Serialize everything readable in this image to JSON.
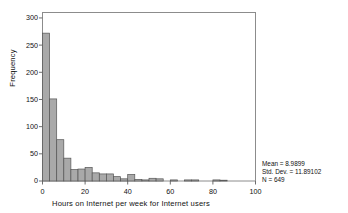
{
  "chart_data": {
    "type": "bar",
    "title": "",
    "subtitle": "",
    "xlabel": "Hours on Internet per week for Internet users",
    "ylabel": "Frequency",
    "xlim": [
      0,
      100
    ],
    "ylim": [
      0,
      310
    ],
    "xticks": [
      0,
      20,
      40,
      60,
      80,
      100
    ],
    "yticks": [
      0,
      50,
      100,
      150,
      200,
      250,
      300
    ],
    "xtick_labels": [
      "0",
      "20",
      "40",
      "60",
      "80",
      "100"
    ],
    "ytick_labels": [
      "0",
      "50",
      "100",
      "150",
      "200",
      "250",
      "300"
    ],
    "grid": false,
    "legend": false,
    "bin_width": 3.33,
    "bar_fill": "#a9a9a9",
    "bar_edge": "#555555",
    "frame_color": "#888888",
    "bins": [
      {
        "x0": 0.0,
        "x1": 3.33,
        "value": 272
      },
      {
        "x0": 3.33,
        "x1": 6.67,
        "value": 151
      },
      {
        "x0": 6.67,
        "x1": 10.0,
        "value": 76
      },
      {
        "x0": 10.0,
        "x1": 13.33,
        "value": 42
      },
      {
        "x0": 13.33,
        "x1": 16.67,
        "value": 21
      },
      {
        "x0": 16.67,
        "x1": 20.0,
        "value": 22
      },
      {
        "x0": 20.0,
        "x1": 23.33,
        "value": 25
      },
      {
        "x0": 23.33,
        "x1": 26.67,
        "value": 15
      },
      {
        "x0": 26.67,
        "x1": 30.0,
        "value": 13
      },
      {
        "x0": 30.0,
        "x1": 33.33,
        "value": 13
      },
      {
        "x0": 33.33,
        "x1": 36.67,
        "value": 8
      },
      {
        "x0": 36.67,
        "x1": 40.0,
        "value": 4
      },
      {
        "x0": 40.0,
        "x1": 43.33,
        "value": 12
      },
      {
        "x0": 43.33,
        "x1": 46.67,
        "value": 3
      },
      {
        "x0": 46.67,
        "x1": 50.0,
        "value": 2
      },
      {
        "x0": 50.0,
        "x1": 53.33,
        "value": 5
      },
      {
        "x0": 53.33,
        "x1": 56.67,
        "value": 4
      },
      {
        "x0": 60.0,
        "x1": 63.33,
        "value": 2
      },
      {
        "x0": 66.67,
        "x1": 70.0,
        "value": 2
      },
      {
        "x0": 70.0,
        "x1": 73.33,
        "value": 2
      },
      {
        "x0": 80.0,
        "x1": 83.33,
        "value": 2
      },
      {
        "x0": 83.33,
        "x1": 86.67,
        "value": 1
      }
    ]
  },
  "stats": {
    "mean_line": "Mean = 8.9899",
    "stddev_line": "Std. Dev. = 11.89102",
    "n_line": "N = 649"
  }
}
